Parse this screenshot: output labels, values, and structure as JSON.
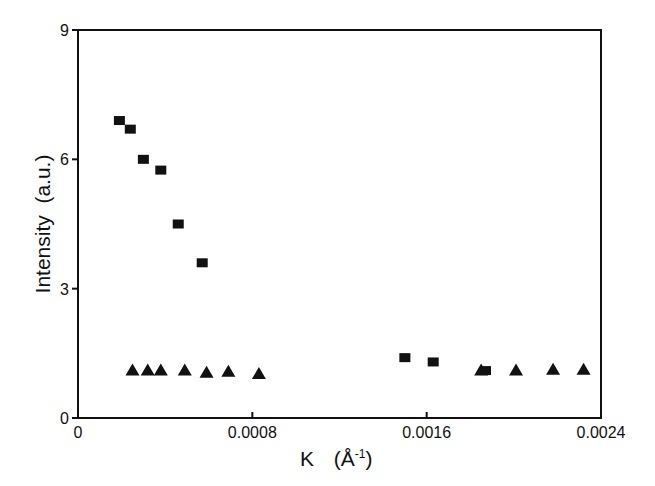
{
  "chart_data": {
    "type": "scatter",
    "title": "",
    "xlabel": "K (Å⁻¹)",
    "ylabel": "Intensity (a.u.)",
    "xlim": [
      0,
      0.0024
    ],
    "ylim": [
      0,
      9
    ],
    "x_ticks": [
      0,
      0.0008,
      0.0016,
      0.0024
    ],
    "x_tick_labels": [
      "0",
      "0.0008",
      "0.0016",
      "0.0024"
    ],
    "y_ticks": [
      0,
      3,
      6,
      9
    ],
    "y_tick_labels": [
      "0",
      "3",
      "6",
      "9"
    ],
    "grid": false,
    "legend": null,
    "series": [
      {
        "name": "squares",
        "marker": "square",
        "color": "#111111",
        "x": [
          0.00019,
          0.00024,
          0.0003,
          0.00038,
          0.00046,
          0.00057,
          0.0015,
          0.00163,
          0.00187
        ],
        "y": [
          6.9,
          6.7,
          6.0,
          5.75,
          4.5,
          3.6,
          1.4,
          1.3,
          1.1
        ]
      },
      {
        "name": "triangles",
        "marker": "triangle",
        "color": "#111111",
        "x": [
          0.00025,
          0.00032,
          0.00038,
          0.00049,
          0.00059,
          0.00069,
          0.00083,
          0.00185,
          0.00201,
          0.00218,
          0.00232
        ],
        "y": [
          1.1,
          1.1,
          1.1,
          1.1,
          1.05,
          1.07,
          1.02,
          1.1,
          1.1,
          1.12,
          1.12
        ]
      }
    ]
  },
  "axes": {
    "x_title_main": "K",
    "x_title_unit": "(Å",
    "x_title_sup": "-1",
    "x_title_close": ")",
    "y_title": "Intensity  (a.u.)"
  }
}
